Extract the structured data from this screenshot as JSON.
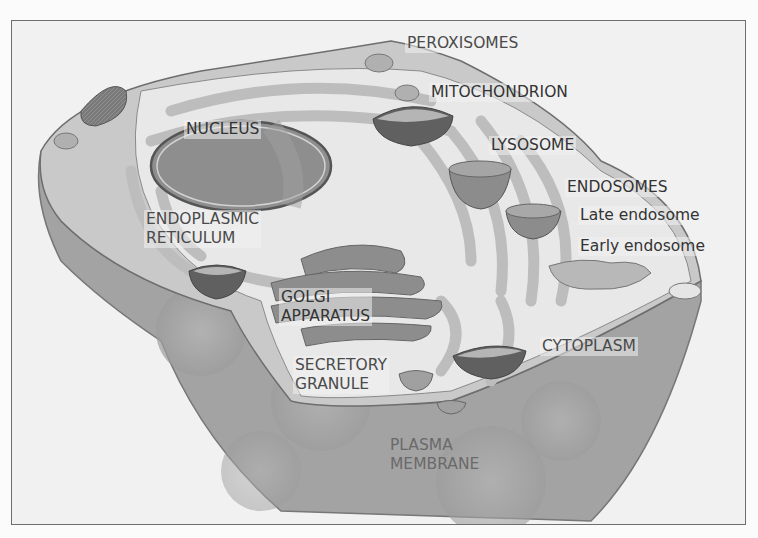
{
  "diagram": {
    "style": "grayscale illustration",
    "labels": {
      "peroxisomes": "PEROXISOMES",
      "mitochondrion": "MITOCHONDRION",
      "nucleus": "NUCLEUS",
      "lysosome": "LYSOSOME",
      "endosomes": "ENDOSOMES",
      "late_endosome": "Late endosome",
      "early_endosome": "Early endosome",
      "endoplasmic_reticulum_line1": "ENDOPLASMIC",
      "endoplasmic_reticulum_line2": "RETICULUM",
      "golgi_line1": "GOLGI",
      "golgi_line2": "APPARATUS",
      "secretory_line1": "SECRETORY",
      "secretory_line2": "GRANULE",
      "cytoplasm": "CYTOPLASM",
      "plasma_membrane_line1": "PLASMA",
      "plasma_membrane_line2": "MEMBRANE"
    },
    "colors": {
      "background": "#f1f1f1",
      "membrane_outer": "#9a9a9a",
      "cytoplasm_fill": "#e9e9e9",
      "organelle_light": "#c4c4c4",
      "organelle_dark": "#6e6e6e",
      "label_text": "#4a4a4a"
    }
  }
}
